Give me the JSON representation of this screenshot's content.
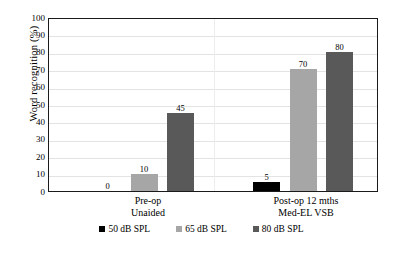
{
  "chart_data": {
    "type": "bar",
    "title": "",
    "xlabel": "",
    "ylabel": "Word  recognition  (%)",
    "ylim": [
      0,
      100
    ],
    "ytick_step": 10,
    "yticks": [
      "0",
      "10",
      "20",
      "30",
      "40",
      "50",
      "60",
      "70",
      "80",
      "90",
      "100"
    ],
    "grid": true,
    "legend_position": "bottom",
    "categories": [
      "Pre-op Unaided",
      "Post-op 12 mths Med-EL VSB"
    ],
    "category_labels": [
      {
        "line1": "Pre-op",
        "line2": "Unaided"
      },
      {
        "line1": "Post-op 12 mths",
        "line2": "Med-EL VSB"
      }
    ],
    "series": [
      {
        "name": "50 dB SPL",
        "color": "#000000",
        "values": [
          0,
          5
        ]
      },
      {
        "name": "65 dB SPL",
        "color": "#a6a6a6",
        "values": [
          10,
          70
        ]
      },
      {
        "name": "80 dB SPL",
        "color": "#595959",
        "values": [
          45,
          80
        ]
      }
    ],
    "data_labels": [
      {
        "series": "50 dB SPL",
        "category": "Pre-op Unaided",
        "text": "0"
      },
      {
        "series": "65 dB SPL",
        "category": "Pre-op Unaided",
        "text": "10"
      },
      {
        "series": "80 dB SPL",
        "category": "Pre-op Unaided",
        "text": "45"
      },
      {
        "series": "50 dB SPL",
        "category": "Post-op 12 mths Med-EL VSB",
        "text": "5"
      },
      {
        "series": "65 dB SPL",
        "category": "Post-op 12 mths Med-EL VSB",
        "text": "70"
      },
      {
        "series": "80 dB SPL",
        "category": "Post-op 12 mths Med-EL VSB",
        "text": "80"
      }
    ]
  },
  "axis": {
    "y_title": "Word  recognition  (%)",
    "ticks": [
      "100",
      "90",
      "80",
      "70",
      "60",
      "50",
      "40",
      "30",
      "20",
      "10",
      "0"
    ]
  },
  "legend": {
    "items": [
      {
        "label": "50 dB SPL",
        "key": "s50"
      },
      {
        "label": "65 dB SPL",
        "key": "s65"
      },
      {
        "label": "80 dB SPL",
        "key": "s80"
      }
    ]
  },
  "caption_sliver": ""
}
